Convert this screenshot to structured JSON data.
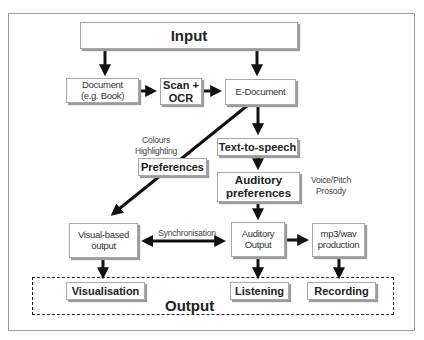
{
  "diagram": {
    "input": {
      "label": "Input"
    },
    "document": {
      "line1": "Document",
      "line2": "(e.g. Book)"
    },
    "scan_ocr": {
      "line1": "Scan +",
      "line2": "OCR"
    },
    "e_document": {
      "label": "E-Document"
    },
    "text_to_speech": {
      "label": "Text-to-speech"
    },
    "preferences": {
      "label": "Preferences"
    },
    "preferences_note": {
      "line1": "Colours",
      "line2": "Highlighting"
    },
    "auditory_preferences": {
      "line1": "Auditory",
      "line2": "preferences"
    },
    "auditory_note": {
      "line1": "Voice/Pitch",
      "line2": "Prosody"
    },
    "visual_output": {
      "line1": "Visual-based",
      "line2": "output"
    },
    "synchronisation": {
      "label": "Synchronisation"
    },
    "auditory_output": {
      "line1": "Auditory",
      "line2": "Output"
    },
    "mp3_production": {
      "line1": "mp3/wav",
      "line2": "production"
    },
    "output_group": {
      "label": "Output"
    },
    "visualisation": {
      "label": "Visualisation"
    },
    "listening": {
      "label": "Listening"
    },
    "recording": {
      "label": "Recording"
    }
  },
  "colors": {
    "line": "#111111",
    "box_border": "#a8a8a8",
    "shadow": "#9c9c9c",
    "frame": "#9a9a9a"
  }
}
